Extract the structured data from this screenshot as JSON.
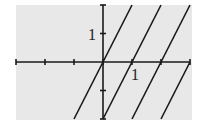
{
  "chart_data": {
    "type": "line",
    "title": "",
    "xlabel": "",
    "ylabel": "",
    "xlim": [
      -3,
      3
    ],
    "ylim": [
      -2,
      2
    ],
    "grid": false,
    "legend": null,
    "tick_labels": {
      "x": [
        "1"
      ],
      "y": [
        "1"
      ]
    },
    "x_ticks": [
      -3,
      -2,
      -1,
      0,
      1,
      2,
      3
    ],
    "y_ticks": [
      -2,
      -1,
      0,
      1,
      2
    ],
    "series": [
      {
        "name": "line-1",
        "slope": 2,
        "x_intercept": 0,
        "points": [
          [
            -1,
            -2
          ],
          [
            1,
            2
          ]
        ]
      },
      {
        "name": "line-2",
        "slope": 2,
        "x_intercept": 1,
        "points": [
          [
            0,
            -2
          ],
          [
            2,
            2
          ]
        ]
      },
      {
        "name": "line-3",
        "slope": 2,
        "x_intercept": 2,
        "points": [
          [
            1,
            -2
          ],
          [
            3,
            2
          ]
        ]
      },
      {
        "name": "line-4",
        "slope": 2,
        "x_intercept": 3,
        "points": [
          [
            2,
            -2
          ],
          [
            3,
            0
          ]
        ]
      }
    ],
    "colors": {
      "background": "#e8e8e8",
      "lines": "#1a1a1a",
      "axes": "#1a1a1a"
    }
  }
}
